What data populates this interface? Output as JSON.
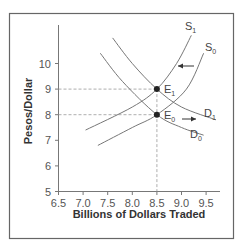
{
  "chart_data": {
    "type": "line",
    "title": "",
    "xlabel": "Billions of Dollars Traded",
    "ylabel": "Pesos/Dollar",
    "xlim": [
      6.5,
      9.8
    ],
    "ylim": [
      5,
      11
    ],
    "x_ticks": [
      "6.5",
      "7.0",
      "7.5",
      "8.0",
      "8.5",
      "9.0",
      "9.5"
    ],
    "y_ticks": [
      "5",
      "6",
      "7",
      "8",
      "9",
      "10"
    ],
    "grid": false,
    "legend": "none",
    "series": [
      {
        "name": "S1",
        "label": "S",
        "sub": "1",
        "kind": "supply",
        "points": [
          [
            7.05,
            7.4
          ],
          [
            8.0,
            8.3
          ],
          [
            8.5,
            9.0
          ],
          [
            8.9,
            10.0
          ],
          [
            9.2,
            11.1
          ]
        ]
      },
      {
        "name": "S0",
        "label": "S",
        "sub": "0",
        "kind": "supply",
        "points": [
          [
            7.3,
            6.8
          ],
          [
            8.0,
            7.5
          ],
          [
            8.5,
            8.0
          ],
          [
            9.1,
            9.0
          ],
          [
            9.45,
            10.4
          ]
        ]
      },
      {
        "name": "D1",
        "label": "D",
        "sub": "1",
        "kind": "demand",
        "points": [
          [
            7.6,
            11.0
          ],
          [
            8.0,
            10.0
          ],
          [
            8.5,
            9.0
          ],
          [
            9.0,
            8.3
          ],
          [
            9.7,
            7.8
          ]
        ]
      },
      {
        "name": "D0",
        "label": "D",
        "sub": "0",
        "kind": "demand",
        "points": [
          [
            7.35,
            10.4
          ],
          [
            7.8,
            9.3
          ],
          [
            8.5,
            8.0
          ],
          [
            9.0,
            7.5
          ],
          [
            9.45,
            7.2
          ]
        ]
      }
    ],
    "equilibria": [
      {
        "name": "E1",
        "label": "E",
        "sub": "1",
        "x": 8.5,
        "y": 9
      },
      {
        "name": "E0",
        "label": "E",
        "sub": "0",
        "x": 8.5,
        "y": 8
      }
    ],
    "annotations": [
      {
        "type": "arrow",
        "direction": "left",
        "note": "supply shift S0 to S1",
        "y": 10.0
      },
      {
        "type": "arrow",
        "direction": "right",
        "note": "demand shift D0 to D1",
        "y": 7.8
      },
      {
        "type": "dashed-line",
        "note": "guide from y=9 to E1"
      },
      {
        "type": "dashed-line",
        "note": "guide from y=8 to E0"
      },
      {
        "type": "dashed-line",
        "note": "guide from E1 down to x=8.5"
      }
    ]
  }
}
